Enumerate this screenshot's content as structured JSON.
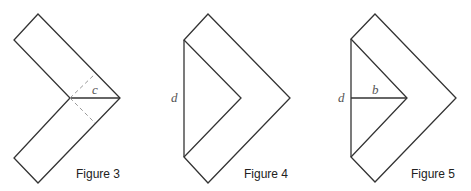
{
  "figures": [
    {
      "caption": "Figure 3",
      "labels": {
        "c": "c"
      }
    },
    {
      "caption": "Figure 4",
      "labels": {
        "d": "d"
      }
    },
    {
      "caption": "Figure 5",
      "labels": {
        "d": "d",
        "b": "b"
      }
    }
  ]
}
